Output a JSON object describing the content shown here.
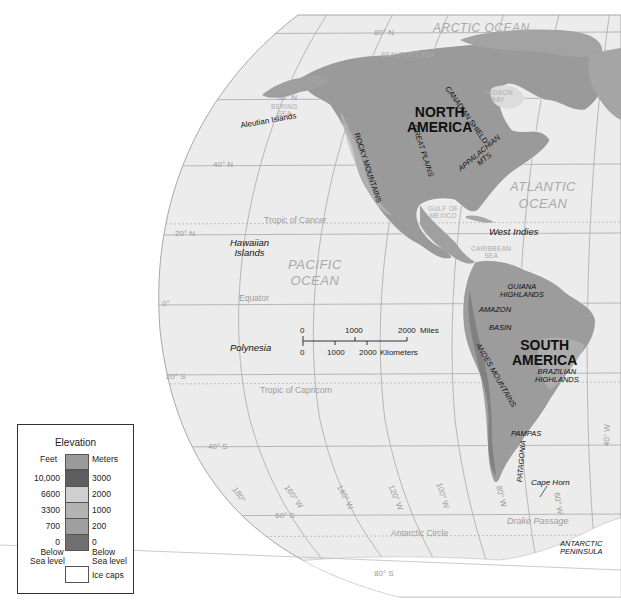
{
  "map": {
    "oceans": [
      {
        "id": "arctic",
        "label": "ARCTIC OCEAN"
      },
      {
        "id": "atlantic",
        "label": "ATLANTIC OCEAN",
        "line1": "ATLANTIC",
        "line2": "OCEAN"
      },
      {
        "id": "pacific",
        "label": "PACIFIC OCEAN",
        "line1": "PACIFIC",
        "line2": "OCEAN"
      }
    ],
    "seas": {
      "beaufort": "BEAUFORT SEA",
      "bering_1": "BERING",
      "bering_2": "SEA",
      "hudson_1": "HUDSON",
      "hudson_2": "BAY",
      "gulf_1": "GULF OF",
      "gulf_2": "MEXICO",
      "caribbean_1": "CARIBBEAN",
      "caribbean_2": "SEA"
    },
    "continents": {
      "north_america_1": "NORTH",
      "north_america_2": "AMERICA",
      "south_america_1": "SOUTH",
      "south_america_2": "AMERICA"
    },
    "features": {
      "rocky": "ROCKY MOUNTAINS",
      "great_plains": "GREAT PLAINS",
      "canadian_shield": "CANADIAN SHIELD",
      "appalachian_1": "APPALACHIAN",
      "appalachian_2": "MTS",
      "guiana_1": "GUIANA",
      "guiana_2": "HIGHLANDS",
      "amazon": "AMAZON",
      "basin": "BASIN",
      "andes": "ANDES MOUNTAINS",
      "brazilian_1": "BRAZILIAN",
      "brazilian_2": "HIGHLANDS",
      "pampas": "PAMPAS",
      "patagonia": "PATAGONIA",
      "antarctic_pen_1": "ANTARCTIC",
      "antarctic_pen_2": "PENINSULA"
    },
    "places": {
      "aleutian": "Aleutian Islands",
      "hawaiian_1": "Hawaiian",
      "hawaiian_2": "Islands",
      "polynesia": "Polynesia",
      "west_indies": "West Indies",
      "cape_horn": "Cape Horn",
      "drake": "Drake Passage"
    },
    "lines": {
      "tropic_cancer": "Tropic of Cancer",
      "equator": "Equator",
      "tropic_capricorn": "Tropic of Capricorn",
      "antarctic_circle": "Antarctic Circle"
    },
    "latitudes": {
      "n80": "80° N",
      "n60": "60° N",
      "n40": "40° N",
      "n20": "20° N",
      "eq": "0°",
      "s20": "20° S",
      "s40": "40° S",
      "s60": "60° S",
      "s80": "80° S"
    },
    "longitudes": {
      "w180": "180°",
      "w160": "160° W",
      "w140": "140° W",
      "w120": "120° W",
      "w100": "100° W",
      "w80": "80° W",
      "w60": "60° W",
      "w40": "40° W"
    },
    "scale": {
      "miles_ticks": [
        "0",
        "1000",
        "2000"
      ],
      "miles_unit": "Miles",
      "km_ticks": [
        "0",
        "1000",
        "2000"
      ],
      "km_unit": "Kilometers"
    }
  },
  "legend": {
    "title": "Elevation",
    "feet_header": "Feet",
    "meters_header": "Meters",
    "feet_ticks": [
      "10,000",
      "6600",
      "3300",
      "700",
      "0"
    ],
    "meters_ticks": [
      "3000",
      "2000",
      "1000",
      "200",
      "0"
    ],
    "below_1": "Below",
    "below_2": "Sea level",
    "ice_caps": "Ice caps",
    "swatch_colors": [
      "#9a9a9a",
      "#5e5e5e",
      "#cfcfcf",
      "#b3b3b3",
      "#9f9f9f",
      "#6f6f6f"
    ]
  }
}
